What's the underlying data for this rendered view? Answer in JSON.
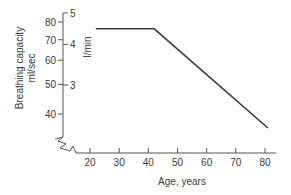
{
  "chart_data": {
    "type": "line",
    "title": "",
    "xlabel": "Age, years",
    "ylabel": "Breathing capacity ml/sec",
    "ylabel_lines": [
      "Breathing capacity",
      "ml/sec"
    ],
    "y2label": "l/min",
    "x_ticks": [
      20,
      30,
      40,
      50,
      60,
      70,
      80
    ],
    "y_ticks": [
      40,
      50,
      60,
      70,
      80
    ],
    "y2_ticks": [
      3,
      4,
      5
    ],
    "y_scale": "log",
    "xlim": [
      15,
      83
    ],
    "ylim": [
      33,
      85
    ],
    "grid": false,
    "axis_break": "y-axis and x-axis broken near origin",
    "series": [
      {
        "name": "Breathing capacity",
        "x": [
          22,
          42,
          81
        ],
        "y": [
          76,
          76,
          36
        ]
      }
    ]
  }
}
